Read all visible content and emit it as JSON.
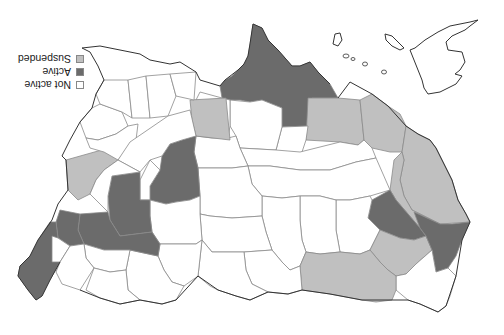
{
  "map": {
    "type": "choropleth",
    "region": "United States",
    "orientation": "rotated 180 degrees",
    "colors": {
      "not_active": "#ffffff",
      "active": "#6b6b6b",
      "suspended": "#c0c0c0",
      "border": "#8a8a8a",
      "coast": "#333333"
    }
  },
  "legend": {
    "items": [
      {
        "label": "Not active",
        "status": "not_active",
        "color": "#ffffff"
      },
      {
        "label": "Active",
        "status": "active",
        "color": "#6b6b6b"
      },
      {
        "label": "Suspended",
        "status": "suspended",
        "color": "#c0c0c0"
      }
    ]
  }
}
